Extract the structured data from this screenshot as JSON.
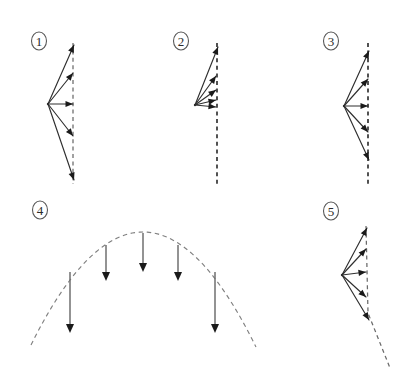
{
  "figure": {
    "background_color": "#ffffff",
    "ray_color": "#2f2f2f",
    "dashed_color": "#6a6a6a",
    "arrowhead_color": "#1a1a1a",
    "field_arrow_color": "#6f6f6f",
    "width": 408,
    "height": 378
  },
  "panels": [
    {
      "id": "panel-1",
      "label": "1",
      "label_x": 39,
      "label_y": 41,
      "kind": "diverging-rays-vertical-dashed",
      "description": "Five rays diverging from a point to a vertical dashed line",
      "vertex": {
        "x": 48,
        "y": 104
      },
      "dashed_line": {
        "x1": 73,
        "y1": 43,
        "x2": 73,
        "y2": 184,
        "style": "light"
      },
      "rays": [
        {
          "x1": 48,
          "y1": 104,
          "x2": 74,
          "y2": 45
        },
        {
          "x1": 48,
          "y1": 104,
          "x2": 73,
          "y2": 73
        },
        {
          "x1": 48,
          "y1": 104,
          "x2": 73,
          "y2": 104
        },
        {
          "x1": 48,
          "y1": 104,
          "x2": 73,
          "y2": 136
        },
        {
          "x1": 48,
          "y1": 104,
          "x2": 74,
          "y2": 180
        }
      ]
    },
    {
      "id": "panel-2",
      "label": "2",
      "label_x": 181,
      "label_y": 41,
      "kind": "converging-rays-upward-heavy-dashed",
      "description": "Five rays from a point all directed upward-right onto a heavy vertical dashed line",
      "vertex": {
        "x": 195,
        "y": 105
      },
      "dashed_line": {
        "x1": 217,
        "y1": 43,
        "x2": 217,
        "y2": 184,
        "style": "heavy"
      },
      "rays": [
        {
          "x1": 195,
          "y1": 105,
          "x2": 218,
          "y2": 47
        },
        {
          "x1": 195,
          "y1": 105,
          "x2": 216,
          "y2": 76
        },
        {
          "x1": 195,
          "y1": 105,
          "x2": 216,
          "y2": 90
        },
        {
          "x1": 195,
          "y1": 105,
          "x2": 216,
          "y2": 100
        },
        {
          "x1": 195,
          "y1": 105,
          "x2": 216,
          "y2": 107
        }
      ]
    },
    {
      "id": "panel-3",
      "label": "3",
      "label_x": 331,
      "label_y": 41,
      "kind": "diverging-rays-long-heavy-dashed",
      "description": "Five rays diverging from a point to a long heavy vertical dashed line",
      "vertex": {
        "x": 344,
        "y": 106
      },
      "dashed_line": {
        "x1": 368,
        "y1": 43,
        "x2": 368,
        "y2": 187,
        "style": "heavy"
      },
      "rays": [
        {
          "x1": 344,
          "y1": 106,
          "x2": 369,
          "y2": 51
        },
        {
          "x1": 344,
          "y1": 106,
          "x2": 368,
          "y2": 79
        },
        {
          "x1": 344,
          "y1": 106,
          "x2": 368,
          "y2": 106
        },
        {
          "x1": 344,
          "y1": 106,
          "x2": 368,
          "y2": 132
        },
        {
          "x1": 344,
          "y1": 106,
          "x2": 369,
          "y2": 160
        }
      ]
    },
    {
      "id": "panel-4",
      "label": "4",
      "label_x": 40,
      "label_y": 210,
      "kind": "parabolic-dashed-curve-with-downward-arrows",
      "description": "Dashed parabolic arc with five downward arrows starting on the curve",
      "curve": {
        "x_left": 31,
        "x_right": 256,
        "apex_x": 143,
        "apex_y": 232,
        "y_ends": 347
      },
      "arrows": [
        {
          "x": 70,
          "y1": 272,
          "y2": 333
        },
        {
          "x": 106,
          "y1": 245,
          "y2": 281
        },
        {
          "x": 143,
          "y1": 233,
          "y2": 272
        },
        {
          "x": 178,
          "y1": 245,
          "y2": 281
        },
        {
          "x": 215,
          "y1": 272,
          "y2": 333
        }
      ]
    },
    {
      "id": "panel-5",
      "label": "5",
      "label_x": 331,
      "label_y": 211,
      "kind": "diverging-rays-bent-dashed",
      "description": "Five rays diverging from a point to a dashed line that bends to the right at the bottom",
      "vertex": {
        "x": 342,
        "y": 275
      },
      "dashed_path": "M 366,226 L 368,313 L 390,368",
      "rays": [
        {
          "x1": 342,
          "y1": 275,
          "x2": 367,
          "y2": 228
        },
        {
          "x1": 342,
          "y1": 275,
          "x2": 366,
          "y2": 249
        },
        {
          "x1": 342,
          "y1": 275,
          "x2": 366,
          "y2": 272
        },
        {
          "x1": 342,
          "y1": 275,
          "x2": 366,
          "y2": 297
        },
        {
          "x1": 342,
          "y1": 275,
          "x2": 369,
          "y2": 320
        }
      ]
    }
  ]
}
